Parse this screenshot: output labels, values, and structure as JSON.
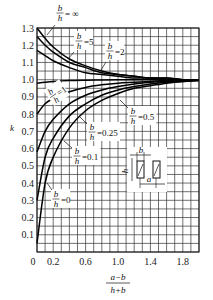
{
  "chart_data": {
    "type": "line",
    "title": "",
    "xlabel": "(a-b)/(h+b)",
    "xlabel_numerator": "a−b",
    "xlabel_denominator": "h+b",
    "ylabel": "k",
    "xlim": [
      0,
      2.0
    ],
    "ylim": [
      0,
      1.3
    ],
    "grid": true,
    "x_ticks": [
      "0",
      "0.2",
      "0.6",
      "1.0",
      "1.4",
      "1.8"
    ],
    "x_tick_values": [
      0,
      0.2,
      0.6,
      1.0,
      1.4,
      1.8
    ],
    "y_ticks": [
      "0.1",
      "0.2",
      "0.3",
      "0.4",
      "0.5",
      "0.6",
      "0.7",
      "0.8",
      "0.9",
      "1.0",
      "1.1",
      "1.2",
      "1.3"
    ],
    "y_tick_values": [
      0.1,
      0.2,
      0.3,
      0.4,
      0.5,
      0.6,
      0.7,
      0.8,
      0.9,
      1.0,
      1.1,
      1.2,
      1.3
    ],
    "x": [
      0,
      0.1,
      0.2,
      0.4,
      0.6,
      0.8,
      1.0,
      1.2,
      1.4,
      1.6,
      1.8,
      2.0
    ],
    "series": [
      {
        "name": "b/h = ∞",
        "label_num": "b",
        "label_den": "h",
        "label_val": "= ∞",
        "values": [
          1.3,
          1.24,
          1.19,
          1.12,
          1.08,
          1.05,
          1.03,
          1.02,
          1.01,
          1.01,
          1.0,
          1.0
        ]
      },
      {
        "name": "b/h = 5",
        "label_num": "b",
        "label_den": "h",
        "label_val": "=5",
        "values": [
          1.25,
          1.2,
          1.16,
          1.1,
          1.07,
          1.04,
          1.03,
          1.02,
          1.01,
          1.01,
          1.0,
          1.0
        ]
      },
      {
        "name": "b/h = 2",
        "label_num": "b",
        "label_den": "h",
        "label_val": "=2",
        "values": [
          1.17,
          1.14,
          1.11,
          1.07,
          1.04,
          1.03,
          1.02,
          1.01,
          1.01,
          1.0,
          1.0,
          1.0
        ]
      },
      {
        "name": "b/h = 1",
        "label_num": "b",
        "label_den": "h",
        "label_val": "=1",
        "values": [
          0.98,
          0.985,
          0.99,
          0.995,
          0.997,
          0.998,
          0.999,
          1.0,
          1.0,
          1.0,
          1.0,
          1.0
        ]
      },
      {
        "name": "b/h = 0.5",
        "label_num": "b",
        "label_den": "h",
        "label_val": "=0.5",
        "values": [
          0.8,
          0.86,
          0.89,
          0.93,
          0.955,
          0.97,
          0.98,
          0.985,
          0.99,
          0.995,
          0.997,
          1.0
        ]
      },
      {
        "name": "b/h = 0.25",
        "label_num": "b",
        "label_den": "h",
        "label_val": "=0.25",
        "values": [
          0.58,
          0.7,
          0.77,
          0.86,
          0.91,
          0.94,
          0.96,
          0.975,
          0.985,
          0.99,
          0.995,
          1.0
        ]
      },
      {
        "name": "b/h = 0.1",
        "label_num": "b",
        "label_den": "h",
        "label_val": "=0.1",
        "values": [
          0.3,
          0.55,
          0.66,
          0.79,
          0.86,
          0.91,
          0.94,
          0.96,
          0.975,
          0.985,
          0.99,
          0.995
        ]
      },
      {
        "name": "b/h = 0",
        "label_num": "b",
        "label_den": "h",
        "label_val": "=0",
        "values": [
          0.05,
          0.4,
          0.55,
          0.72,
          0.82,
          0.88,
          0.92,
          0.95,
          0.965,
          0.98,
          0.99,
          0.995
        ]
      }
    ],
    "inset": {
      "description": "Two hatched rectangular conductors side by side",
      "dim_width": "b",
      "dim_height": "h",
      "dim_spacing": "a"
    },
    "legend": "none (inline curve labels)"
  }
}
